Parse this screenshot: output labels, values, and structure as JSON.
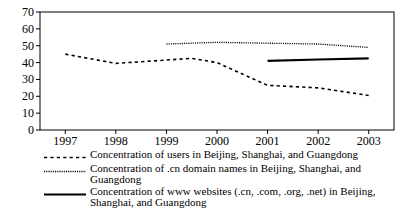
{
  "chart_data": {
    "type": "line",
    "title": "",
    "xlabel": "",
    "ylabel": "",
    "xlim": [
      1996.5,
      2003.5
    ],
    "ylim": [
      0,
      70
    ],
    "grid": false,
    "legend_position": "below",
    "x_ticks": [
      "1997",
      "1998",
      "1999",
      "2000",
      "2001",
      "2002",
      "2003"
    ],
    "y_ticks": [
      "0",
      "10",
      "20",
      "30",
      "40",
      "50",
      "60",
      "70"
    ],
    "series": [
      {
        "name": "Concentration of users in Beijing, Shanghai, and Guangdong",
        "style": "dashed",
        "x": [
          1997,
          1998,
          1999,
          1999.5,
          2000,
          2001,
          2002,
          2003
        ],
        "values": [
          45,
          39.5,
          41.5,
          42.5,
          40,
          26.5,
          25,
          20.5
        ]
      },
      {
        "name": "Concentration of .cn domain names in Beijing, Shanghai, and Guangdong",
        "style": "dotted",
        "x": [
          1999,
          2000,
          2001,
          2002,
          2003
        ],
        "values": [
          51,
          52,
          51.5,
          51,
          49
        ]
      },
      {
        "name": "Concentration of www websites (.cn, .com, .org, .net) in Beijing, Shanghai, and Guangdong",
        "style": "solid",
        "x": [
          2001,
          2002,
          2003
        ],
        "values": [
          41,
          41.8,
          42.5
        ]
      }
    ]
  },
  "legend": {
    "entries": [
      {
        "key": "dashed-line-key",
        "label": "Concentration of users in Beijing, Shanghai, and Guangdong"
      },
      {
        "key": "dotted-line-key",
        "label": "Concentration of .cn domain names in Beijing, Shanghai, and Guangdong"
      },
      {
        "key": "solid-line-key",
        "label_part1": "Concentration of www websites (.cn, .com, .org, .net) in Beijing,",
        "label_part2": "Shanghai, and Guangdong"
      }
    ]
  },
  "colors": {
    "axis": "#000000",
    "series": "#000000",
    "background": "#ffffff"
  }
}
